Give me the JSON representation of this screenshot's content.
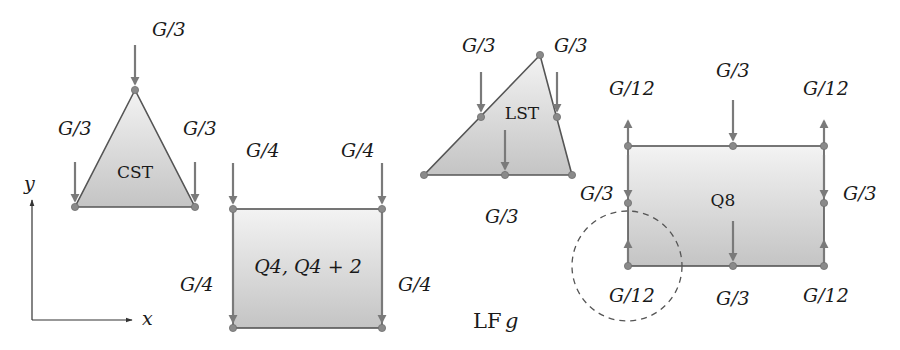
{
  "figure": {
    "caption_label": "LF",
    "caption_symbol": "g",
    "axes": {
      "x_label": "x",
      "y_label": "y"
    }
  },
  "elements": {
    "cst": {
      "name": "CST",
      "loads": {
        "top": "G/3",
        "left": "G/3",
        "right": "G/3"
      }
    },
    "q4": {
      "name": "Q4, Q4 + 2",
      "loads": {
        "top_left": "G/4",
        "top_right": "G/4",
        "bottom_left": "G/4",
        "bottom_right": "G/4"
      }
    },
    "lst": {
      "name": "LST",
      "loads": {
        "mid_left_edge": "G/3",
        "mid_right_edge": "G/3",
        "mid_bottom_edge": "G/3"
      }
    },
    "q8": {
      "name": "Q8",
      "loads": {
        "top_left_corner": "G/12",
        "top_mid": "G/3",
        "top_right_corner": "G/12",
        "mid_left": "G/3",
        "mid_right": "G/3",
        "bottom_left_corner": "G/12",
        "bottom_mid": "G/3",
        "bottom_right_corner": "G/12"
      }
    }
  },
  "colors": {
    "fill_light": "#f2f2f2",
    "fill_dark": "#c6c6c6",
    "arrow": "#7a7a7a",
    "node": "#8a8a8a",
    "edge": "#555555"
  }
}
